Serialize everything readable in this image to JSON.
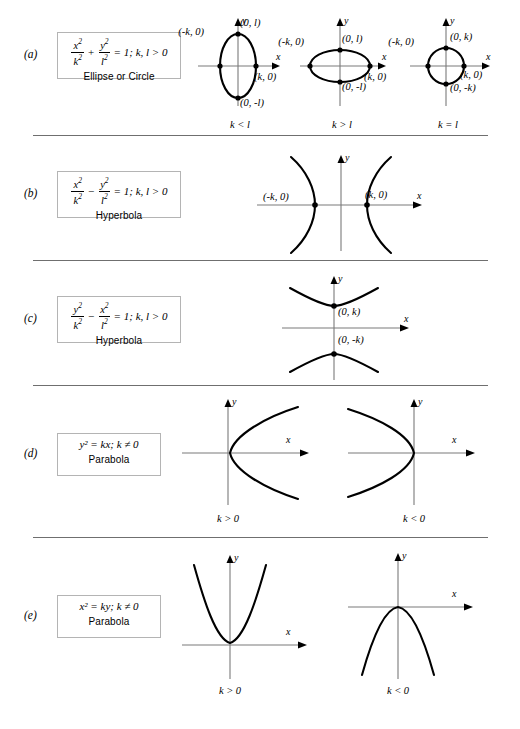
{
  "figure": {
    "axis_x_label": "x",
    "axis_y_label": "y"
  },
  "rows": [
    {
      "label": "(a)",
      "equation": {
        "num1": "x",
        "den1": "k",
        "op": "+",
        "num2": "y",
        "den2": "l",
        "tail": "= 1; k, l > 0"
      },
      "name": "Ellipse or Circle",
      "figures": [
        {
          "caption": "k < l",
          "points": [
            "(-k, 0)",
            "(0, l)",
            "(k, 0)",
            "(0, -l)"
          ]
        },
        {
          "caption": "k > l",
          "points": [
            "(-k, 0)",
            "(0, l)",
            "(k, 0)",
            "(0, -l)"
          ]
        },
        {
          "caption": "k = l",
          "points": [
            "(-k, 0)",
            "(0, k)",
            "(k, 0)",
            "(0, -k)"
          ]
        }
      ]
    },
    {
      "label": "(b)",
      "equation": {
        "num1": "x",
        "den1": "k",
        "op": "−",
        "num2": "y",
        "den2": "l",
        "tail": "= 1; k, l > 0"
      },
      "name": "Hyperbola",
      "figures": [
        {
          "caption": "",
          "points": [
            "(-k, 0)",
            "(k, 0)"
          ]
        }
      ]
    },
    {
      "label": "(c)",
      "equation": {
        "num1": "y",
        "den1": "k",
        "op": "−",
        "num2": "x",
        "den2": "l",
        "tail": "= 1; k, l > 0"
      },
      "name": "Hyperbola",
      "figures": [
        {
          "caption": "",
          "points": [
            "(0, k)",
            "(0, -k)"
          ]
        }
      ]
    },
    {
      "label": "(d)",
      "equation_simple": "y² = kx; k ≠ 0",
      "name": "Parabola",
      "figures": [
        {
          "caption": "k > 0",
          "points": []
        },
        {
          "caption": "k < 0",
          "points": []
        }
      ]
    },
    {
      "label": "(e)",
      "equation_simple": "x² = ky; k ≠ 0",
      "name": "Parabola",
      "figures": [
        {
          "caption": "k > 0",
          "points": []
        },
        {
          "caption": "k < 0",
          "points": []
        }
      ]
    }
  ],
  "colors": {
    "axis": "#7a7a7a",
    "curve": "#000000",
    "rule": "#6f6f6f",
    "box_border": "#b4b4b4",
    "background": "#ffffff"
  }
}
